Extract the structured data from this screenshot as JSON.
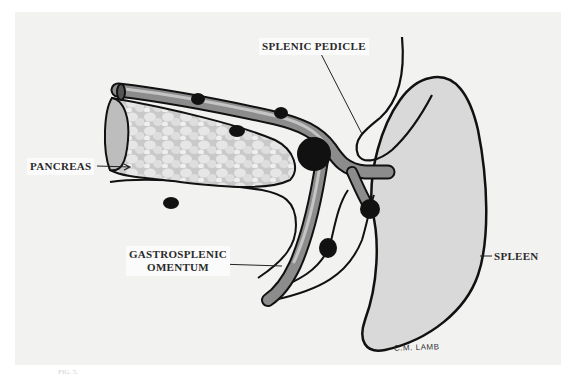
{
  "figure": {
    "labels": {
      "splenic_pedicle": "SPLENIC PEDICLE",
      "pancreas": "PANCREAS",
      "gastrosplenic_omentum_line1": "GASTROSPLENIC",
      "gastrosplenic_omentum_line2": "OMENTUM",
      "spleen": "SPLEEN"
    },
    "signature": "C.M. LAMB",
    "caption_fragment": "FIG. 5."
  },
  "colors": {
    "plate_background": "#f2f2f1",
    "spleen_fill": "#d9d9d9",
    "vessel_fill": "#8c8c8c",
    "vessel_highlight": "#c4c4c4",
    "pancreas_fill": "#cfcfcf",
    "lymph_node": "#111111",
    "outline": "#111111"
  }
}
